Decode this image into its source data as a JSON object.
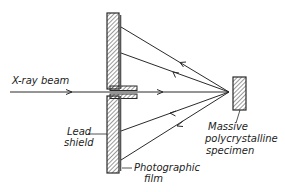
{
  "diagram": {
    "type": "x-ray back-reflection pinhole camera schematic",
    "labels": {
      "xray_beam": "X-ray beam",
      "lead_shield_line1": "Lead",
      "lead_shield_line2": "shield",
      "film_line1": "Photographic",
      "film_line2": "film",
      "specimen_line1": "Massive",
      "specimen_line2": "polycrystalline",
      "specimen_line3": "specimen"
    },
    "components": [
      "X-ray beam",
      "Lead shield",
      "Collimator",
      "Photographic film",
      "Massive polycrystalline specimen"
    ],
    "rays": {
      "incident": 1,
      "diffracted": 4
    },
    "colors": {
      "ink": "#2a2a2a",
      "background": "#ffffff"
    }
  }
}
